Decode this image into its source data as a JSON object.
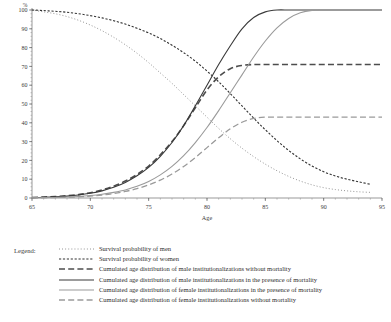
{
  "chart_data": {
    "type": "line",
    "title": "",
    "xlabel": "Age",
    "ylabel": "%",
    "xlim": [
      65,
      95
    ],
    "ylim": [
      0,
      100
    ],
    "xticks": [
      65,
      70,
      75,
      80,
      85,
      90,
      95
    ],
    "yticks": [
      0,
      10,
      20,
      30,
      40,
      50,
      60,
      70,
      80,
      90,
      100
    ],
    "x_minor_tick_step": 1,
    "y_minor_tick_step": 2,
    "grid": false,
    "legend_position": "below-plot-left",
    "x": [
      65,
      66,
      67,
      68,
      69,
      70,
      71,
      72,
      73,
      74,
      75,
      76,
      77,
      78,
      79,
      80,
      81,
      82,
      83,
      84,
      85,
      86,
      87,
      88,
      89,
      90,
      91,
      92,
      93,
      94,
      95
    ],
    "series": [
      {
        "name": "Survival probability of men",
        "key": "survival_men",
        "style": "dotted",
        "color": "#8a8a8a",
        "width": 1.0,
        "x_end": 94,
        "values": [
          100,
          99,
          98,
          96.5,
          94.5,
          92,
          89,
          85.5,
          81.5,
          77,
          72,
          66.5,
          61,
          55,
          49,
          43,
          37,
          31.5,
          26.5,
          22,
          18,
          14.5,
          11.5,
          9,
          7,
          5.5,
          4.5,
          3.8,
          3.3,
          3,
          null
        ]
      },
      {
        "name": "Survival probability of women",
        "key": "survival_women",
        "style": "dashed-fine",
        "color": "#333333",
        "width": 1.1,
        "x_end": 94,
        "values": [
          100,
          99.7,
          99.3,
          98.8,
          98,
          97,
          95.8,
          94.3,
          92.5,
          90.3,
          87.8,
          84.8,
          81.3,
          77.3,
          72.8,
          67.5,
          61.8,
          55.5,
          49,
          42.5,
          36.3,
          30.5,
          25.3,
          20.8,
          17,
          14,
          11.7,
          10,
          8.6,
          7.3,
          null
        ]
      },
      {
        "name": "Cumulated age distribution of male institutionalizations without mortality",
        "key": "male_inst_no_mortality",
        "style": "dashed-coarse",
        "color": "#4d4d4d",
        "width": 1.6,
        "values": [
          0.3,
          0.5,
          0.8,
          1.2,
          1.8,
          2.8,
          4.3,
          6.3,
          9,
          12.5,
          17,
          23,
          30,
          38.5,
          48,
          57.5,
          64.5,
          68.8,
          70.5,
          71,
          71,
          71,
          71,
          71,
          71,
          71,
          71,
          71,
          71,
          71,
          71
        ],
        "plateau": 71
      },
      {
        "name": "Cumulated age distribution of male institutionalizations in the presence of mortality",
        "key": "male_inst_with_mortality",
        "style": "solid",
        "color": "#3a3a3a",
        "width": 1.1,
        "values": [
          0.2,
          0.35,
          0.6,
          1,
          1.6,
          2.5,
          3.8,
          5.7,
          8.3,
          11.8,
          16.3,
          22.2,
          29.5,
          38.5,
          49,
          60,
          71,
          81,
          90,
          96,
          99,
          100,
          100,
          100,
          100,
          100,
          100,
          100,
          100,
          100,
          100
        ],
        "plateau": 100
      },
      {
        "name": "Cumulated age distribution of female institutionalizations in the presence of mortality",
        "key": "female_inst_with_mortality",
        "style": "solid",
        "color": "#9a9a9a",
        "width": 1.1,
        "values": [
          0.1,
          0.2,
          0.3,
          0.5,
          0.8,
          1.3,
          2,
          3,
          4.3,
          6.2,
          8.8,
          12.3,
          16.8,
          22.5,
          29.5,
          37.5,
          46.5,
          56,
          65.5,
          75,
          83.5,
          90.5,
          95.5,
          98.5,
          99.8,
          100,
          100,
          100,
          100,
          100,
          100
        ],
        "plateau": 100
      },
      {
        "name": "Cumulated age distribution of female institutionalizations without mortality",
        "key": "female_inst_no_mortality",
        "style": "dashed-coarse",
        "color": "#9a9a9a",
        "width": 1.3,
        "values": [
          0.1,
          0.15,
          0.25,
          0.4,
          0.6,
          1,
          1.6,
          2.4,
          3.5,
          5,
          7,
          9.5,
          12.8,
          16.8,
          21.5,
          26.8,
          32,
          36.8,
          40.3,
          42.3,
          43,
          43,
          43,
          43,
          43,
          43,
          43,
          43,
          43,
          43,
          43
        ],
        "plateau": 43
      }
    ]
  },
  "legend": {
    "title": "Legend:",
    "entries": [
      {
        "label": "Survival probability of men"
      },
      {
        "label": "Survival probability of women"
      },
      {
        "label": "Cumulated age distribution of male institutionalizations without mortality"
      },
      {
        "label": "Cumulated age distribution of male institutionalizations in the presence of mortality"
      },
      {
        "label": "Cumulated age distribution of female institutionalizations in the presence of mortality"
      },
      {
        "label": "Cumulated age distribution of female institutionalizations without mortality"
      }
    ]
  }
}
